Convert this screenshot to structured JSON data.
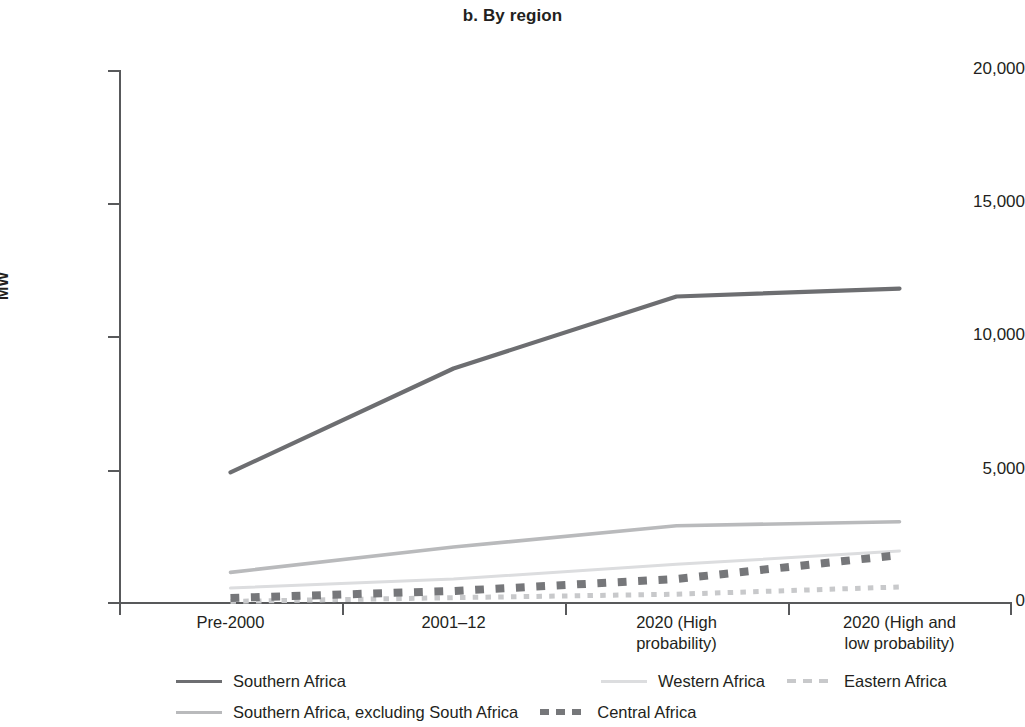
{
  "chart_data": {
    "type": "line",
    "title": "b. By region",
    "xlabel": "",
    "ylabel": "MW",
    "ylim": [
      0,
      20000
    ],
    "yticks": [
      0,
      5000,
      10000,
      15000,
      20000
    ],
    "ytick_labels": [
      "0",
      "5,000",
      "10,000",
      "15,000",
      "20,000"
    ],
    "grid": false,
    "legend_position": "bottom",
    "categories": [
      "Pre-2000",
      "2001–12",
      "2020 (High\nprobability)",
      "2020 (High and\nlow probability)"
    ],
    "category_lines": [
      [
        "Pre-2000"
      ],
      [
        "2001–12"
      ],
      [
        "2020 (High",
        "probability)"
      ],
      [
        "2020 (High and",
        "low probability)"
      ]
    ],
    "series": [
      {
        "name": "Southern Africa",
        "values": [
          4900,
          8800,
          11500,
          11800
        ],
        "color": "#6d6e71",
        "style": "solid",
        "width": 4.2
      },
      {
        "name": "Southern Africa, excluding South Africa",
        "values": [
          1150,
          2100,
          2900,
          3050
        ],
        "color": "#b9babc",
        "style": "solid",
        "width": 3.6
      },
      {
        "name": "Western Africa",
        "values": [
          560,
          900,
          1450,
          1950
        ],
        "color": "#dcdddf",
        "style": "solid",
        "width": 3.0
      },
      {
        "name": "Central Africa",
        "values": [
          190,
          450,
          900,
          1800
        ],
        "color": "#76777a",
        "style": "dashed",
        "width": 8.0
      },
      {
        "name": "Eastern Africa",
        "values": [
          60,
          200,
          330,
          600
        ],
        "color": "#c8c9cb",
        "style": "dashed",
        "width": 5.0
      }
    ]
  },
  "chart": {
    "title": "b. By region",
    "y_axis": {
      "label": "MW",
      "ticks": [
        "20,000",
        "15,000",
        "10,000",
        "5,000",
        "0"
      ]
    },
    "x_axis": {
      "categories": [
        {
          "line1": "Pre-2000",
          "line2": ""
        },
        {
          "line1": "2001–12",
          "line2": ""
        },
        {
          "line1": "2020 (High",
          "line2": "probability)"
        },
        {
          "line1": "2020 (High and",
          "line2": "low probability)"
        }
      ]
    },
    "legend": {
      "items": [
        {
          "label": "Southern Africa"
        },
        {
          "label": "Southern Africa, excluding South Africa"
        },
        {
          "label": "Western Africa"
        },
        {
          "label": "Eastern Africa"
        },
        {
          "label": "Central Africa"
        }
      ]
    }
  }
}
